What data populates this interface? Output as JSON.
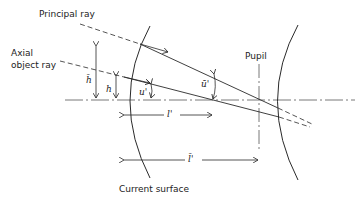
{
  "diagram": {
    "type": "optical ray diagram",
    "labels": {
      "principal_ray": "Principal ray",
      "axial_ray_line1": "Axial",
      "axial_ray_line2": "object ray",
      "pupil": "Pupil",
      "current_surface": "Current surface"
    },
    "symbols": {
      "h_bar": "h̄",
      "h": "h",
      "u_prime": "u'",
      "u_bar_prime": "ū'",
      "l_prime": "l'",
      "l_bar_prime": "l̄'"
    },
    "elements": [
      "optical-axis",
      "current-surface",
      "second-surface",
      "pupil-line",
      "principal-ray",
      "axial-object-ray"
    ],
    "colors": {
      "ink": "#2a2a2a",
      "background": "#ffffff"
    }
  }
}
